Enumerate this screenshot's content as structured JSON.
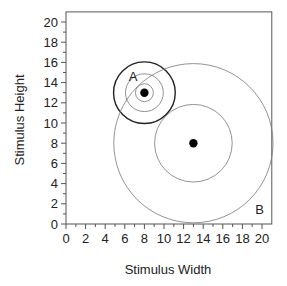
{
  "chart_data": {
    "type": "scatter",
    "title": "",
    "xlabel": "Stimulus Width",
    "ylabel": "Stimulus Height",
    "xlim": [
      0,
      21
    ],
    "ylim": [
      0,
      21
    ],
    "xticks": [
      0,
      2,
      4,
      6,
      8,
      10,
      12,
      14,
      16,
      18,
      20
    ],
    "yticks": [
      0,
      2,
      4,
      6,
      8,
      10,
      12,
      14,
      16,
      18,
      20
    ],
    "grid": false,
    "legend": null,
    "points": [
      {
        "label": "A",
        "x": 8,
        "y": 13,
        "circle_radii": [
          0.9,
          1.9,
          3.1
        ],
        "outer_circle_bold": true
      },
      {
        "label": "B",
        "x": 13,
        "y": 8,
        "circle_radii": [
          3.9,
          8.0
        ],
        "outer_circle_bold": false
      }
    ],
    "annotations": [
      {
        "text": "A",
        "x": 6.4,
        "y": 14.2
      },
      {
        "text": "B",
        "x": 19.3,
        "y": 1.0
      }
    ]
  },
  "labels": {
    "x_axis": "Stimulus Width",
    "y_axis": "Stimulus Height",
    "point_a": "A",
    "point_b": "B"
  }
}
